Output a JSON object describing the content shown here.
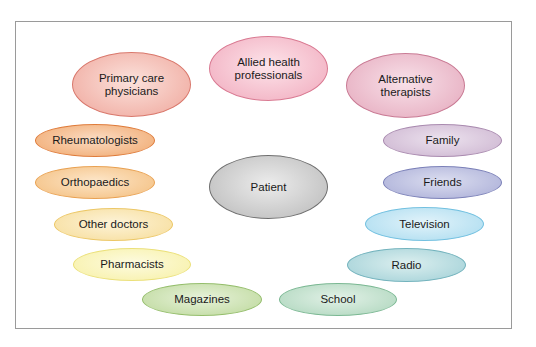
{
  "diagram": {
    "center": {
      "label": "Patient",
      "x": 209,
      "y": 155,
      "w": 119,
      "h": 64,
      "fill": "#b8b8b8",
      "light": "#ececec",
      "border": "#6e6e6e"
    },
    "nodes": [
      {
        "id": "primary-care-physicians",
        "label": "Primary care\nphysicians",
        "x": 72,
        "y": 52,
        "w": 119,
        "h": 65,
        "fill": "#efa59a",
        "light": "#fbe2dc",
        "border": "#d9786c"
      },
      {
        "id": "allied-health-professionals",
        "label": "Allied health\nprofessionals",
        "x": 209,
        "y": 36,
        "w": 119,
        "h": 65,
        "fill": "#f0a9bc",
        "light": "#fde4ea",
        "border": "#d97a92"
      },
      {
        "id": "alternative-therapists",
        "label": "Alternative\ntherapists",
        "x": 346,
        "y": 53,
        "w": 119,
        "h": 65,
        "fill": "#e4a7bb",
        "light": "#f8e1e9",
        "border": "#c97a94"
      },
      {
        "id": "rheumatologists",
        "label": "Rheumatologists",
        "x": 35,
        "y": 124,
        "w": 120,
        "h": 33,
        "fill": "#f0a76c",
        "light": "#fbdcc3",
        "border": "#df7c3b"
      },
      {
        "id": "orthopaedics",
        "label": "Orthopaedics",
        "x": 35,
        "y": 166,
        "w": 120,
        "h": 33,
        "fill": "#f3bd7c",
        "light": "#fde6c9",
        "border": "#e9a253"
      },
      {
        "id": "other-doctors",
        "label": "Other doctors",
        "x": 54,
        "y": 208,
        "w": 119,
        "h": 33,
        "fill": "#f6dc98",
        "light": "#fdf3d8",
        "border": "#ecc766"
      },
      {
        "id": "pharmacists",
        "label": "Pharmacists",
        "x": 73,
        "y": 248,
        "w": 118,
        "h": 33,
        "fill": "#f7f0a4",
        "light": "#fdfbe0",
        "border": "#ebe07a"
      },
      {
        "id": "magazines",
        "label": "Magazines",
        "x": 142,
        "y": 283,
        "w": 120,
        "h": 33,
        "fill": "#bcd89a",
        "light": "#e7f2da",
        "border": "#95be6c"
      },
      {
        "id": "family",
        "label": "Family",
        "x": 383,
        "y": 124,
        "w": 119,
        "h": 33,
        "fill": "#cbb3cf",
        "light": "#ece2ee",
        "border": "#a98aaf"
      },
      {
        "id": "friends",
        "label": "Friends",
        "x": 383,
        "y": 166,
        "w": 119,
        "h": 33,
        "fill": "#a8acd6",
        "light": "#dcdef0",
        "border": "#7b80b8"
      },
      {
        "id": "television",
        "label": "Television",
        "x": 365,
        "y": 207,
        "w": 119,
        "h": 34,
        "fill": "#a9dbef",
        "light": "#e2f3fa",
        "border": "#72c0e0"
      },
      {
        "id": "radio",
        "label": "Radio",
        "x": 347,
        "y": 248,
        "w": 119,
        "h": 34,
        "fill": "#9fcfd6",
        "light": "#dcefef",
        "border": "#73b3bd"
      },
      {
        "id": "school",
        "label": "School",
        "x": 279,
        "y": 283,
        "w": 118,
        "h": 33,
        "fill": "#acd5bb",
        "light": "#e2f1e7",
        "border": "#7bb893"
      }
    ]
  }
}
